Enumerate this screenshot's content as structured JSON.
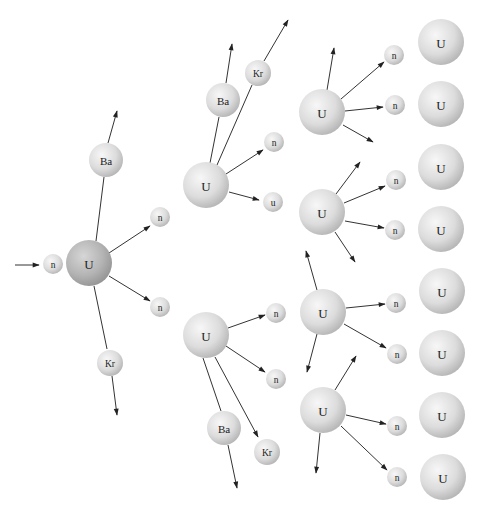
{
  "colors": {
    "background": "#ffffff",
    "line": "#333333",
    "text": "#222222",
    "sphere_light": "#f4f4f4",
    "sphere_dark": "#b5b5b5",
    "sphere_uranium_center_dark": "#a8a8a8"
  },
  "labels": {
    "uranium": "U",
    "neutron": "n",
    "barium": "Ba",
    "krypton": "Kr",
    "neutron_misprint": "u"
  },
  "particles": [
    {
      "id": "g1-n-in",
      "label": "n",
      "x": 53,
      "y": 264,
      "r": 10
    },
    {
      "id": "g1-U",
      "label": "U",
      "x": 89,
      "y": 263,
      "r": 23,
      "dark": true
    },
    {
      "id": "g1-Ba",
      "label": "Ba",
      "x": 106,
      "y": 160,
      "r": 17
    },
    {
      "id": "g1-Kr",
      "label": "Kr",
      "x": 110,
      "y": 363,
      "r": 13
    },
    {
      "id": "g1-n1",
      "label": "n",
      "x": 160,
      "y": 217,
      "r": 10
    },
    {
      "id": "g1-n2",
      "label": "n",
      "x": 160,
      "y": 307,
      "r": 10
    },
    {
      "id": "g2a-U",
      "label": "U",
      "x": 206,
      "y": 185,
      "r": 23
    },
    {
      "id": "g2a-Ba",
      "label": "Ba",
      "x": 223,
      "y": 100,
      "r": 17
    },
    {
      "id": "g2a-Kr",
      "label": "Kr",
      "x": 258,
      "y": 73,
      "r": 13
    },
    {
      "id": "g2a-n1",
      "label": "n",
      "x": 274,
      "y": 142,
      "r": 10
    },
    {
      "id": "g2a-n2",
      "label": "u",
      "x": 273,
      "y": 202,
      "r": 10
    },
    {
      "id": "g2b-U",
      "label": "U",
      "x": 206,
      "y": 335,
      "r": 23
    },
    {
      "id": "g2b-n1",
      "label": "n",
      "x": 276,
      "y": 313,
      "r": 10
    },
    {
      "id": "g2b-n2",
      "label": "n",
      "x": 276,
      "y": 379,
      "r": 10
    },
    {
      "id": "g2b-Ba",
      "label": "Ba",
      "x": 224,
      "y": 428,
      "r": 17
    },
    {
      "id": "g2b-Kr",
      "label": "Kr",
      "x": 267,
      "y": 452,
      "r": 13
    },
    {
      "id": "g3a-U",
      "label": "U",
      "x": 322,
      "y": 112,
      "r": 23
    },
    {
      "id": "g3b-U",
      "label": "U",
      "x": 322,
      "y": 212,
      "r": 23
    },
    {
      "id": "g3c-U",
      "label": "U",
      "x": 323,
      "y": 312,
      "r": 23
    },
    {
      "id": "g3d-U",
      "label": "U",
      "x": 323,
      "y": 410,
      "r": 23
    },
    {
      "id": "g3a-n1",
      "label": "n",
      "x": 394,
      "y": 55,
      "r": 10
    },
    {
      "id": "g3a-n2",
      "label": "n",
      "x": 395,
      "y": 105,
      "r": 10
    },
    {
      "id": "g3b-n1",
      "label": "n",
      "x": 396,
      "y": 180,
      "r": 10
    },
    {
      "id": "g3b-n2",
      "label": "n",
      "x": 395,
      "y": 230,
      "r": 10
    },
    {
      "id": "g3c-n1",
      "label": "n",
      "x": 396,
      "y": 303,
      "r": 10
    },
    {
      "id": "g3c-n2",
      "label": "n",
      "x": 397,
      "y": 354,
      "r": 10
    },
    {
      "id": "g3d-n1",
      "label": "n",
      "x": 397,
      "y": 426,
      "r": 10
    },
    {
      "id": "g3d-n2",
      "label": "n",
      "x": 397,
      "y": 477,
      "r": 10
    },
    {
      "id": "t-U1",
      "label": "U",
      "x": 441,
      "y": 42,
      "r": 23
    },
    {
      "id": "t-U2",
      "label": "U",
      "x": 441,
      "y": 104,
      "r": 23
    },
    {
      "id": "t-U3",
      "label": "U",
      "x": 441,
      "y": 167,
      "r": 23
    },
    {
      "id": "t-U4",
      "label": "U",
      "x": 441,
      "y": 229,
      "r": 23
    },
    {
      "id": "t-U5",
      "label": "U",
      "x": 442,
      "y": 291,
      "r": 23
    },
    {
      "id": "t-U6",
      "label": "U",
      "x": 442,
      "y": 353,
      "r": 23
    },
    {
      "id": "t-U7",
      "label": "U",
      "x": 442,
      "y": 415,
      "r": 23
    },
    {
      "id": "t-U8",
      "label": "U",
      "x": 443,
      "y": 477,
      "r": 23
    }
  ],
  "arrows": [
    {
      "x1": 15,
      "y1": 265,
      "x2": 39,
      "y2": 265,
      "head": true
    },
    {
      "x1": 96,
      "y1": 241,
      "x2": 104,
      "y2": 177,
      "head": false
    },
    {
      "x1": 108,
      "y1": 143,
      "x2": 117,
      "y2": 111,
      "head": true
    },
    {
      "x1": 109,
      "y1": 253,
      "x2": 150,
      "y2": 226,
      "head": true
    },
    {
      "x1": 109,
      "y1": 276,
      "x2": 150,
      "y2": 301,
      "head": true
    },
    {
      "x1": 94,
      "y1": 286,
      "x2": 107,
      "y2": 349,
      "head": false
    },
    {
      "x1": 112,
      "y1": 376,
      "x2": 117,
      "y2": 415,
      "head": true
    },
    {
      "x1": 210,
      "y1": 163,
      "x2": 219,
      "y2": 117,
      "head": false
    },
    {
      "x1": 226,
      "y1": 83,
      "x2": 232,
      "y2": 44,
      "head": true
    },
    {
      "x1": 217,
      "y1": 165,
      "x2": 252,
      "y2": 85,
      "head": false
    },
    {
      "x1": 264,
      "y1": 61,
      "x2": 288,
      "y2": 20,
      "head": true
    },
    {
      "x1": 226,
      "y1": 174,
      "x2": 263,
      "y2": 150,
      "head": true
    },
    {
      "x1": 229,
      "y1": 192,
      "x2": 259,
      "y2": 200,
      "head": true
    },
    {
      "x1": 228,
      "y1": 328,
      "x2": 265,
      "y2": 315,
      "head": true
    },
    {
      "x1": 226,
      "y1": 346,
      "x2": 265,
      "y2": 372,
      "head": true
    },
    {
      "x1": 203,
      "y1": 358,
      "x2": 221,
      "y2": 411,
      "head": false
    },
    {
      "x1": 228,
      "y1": 445,
      "x2": 237,
      "y2": 488,
      "head": true
    },
    {
      "x1": 215,
      "y1": 357,
      "x2": 258,
      "y2": 437,
      "head": true
    },
    {
      "x1": 327,
      "y1": 90,
      "x2": 334,
      "y2": 48,
      "head": true
    },
    {
      "x1": 341,
      "y1": 99,
      "x2": 384,
      "y2": 62,
      "head": true
    },
    {
      "x1": 345,
      "y1": 111,
      "x2": 383,
      "y2": 107,
      "head": true
    },
    {
      "x1": 343,
      "y1": 125,
      "x2": 373,
      "y2": 142,
      "head": true
    },
    {
      "x1": 336,
      "y1": 194,
      "x2": 360,
      "y2": 162,
      "head": true
    },
    {
      "x1": 344,
      "y1": 203,
      "x2": 385,
      "y2": 186,
      "head": true
    },
    {
      "x1": 345,
      "y1": 221,
      "x2": 384,
      "y2": 228,
      "head": true
    },
    {
      "x1": 335,
      "y1": 232,
      "x2": 355,
      "y2": 262,
      "head": true
    },
    {
      "x1": 317,
      "y1": 290,
      "x2": 306,
      "y2": 251,
      "head": true
    },
    {
      "x1": 346,
      "y1": 308,
      "x2": 385,
      "y2": 304,
      "head": true
    },
    {
      "x1": 344,
      "y1": 324,
      "x2": 386,
      "y2": 348,
      "head": true
    },
    {
      "x1": 317,
      "y1": 334,
      "x2": 307,
      "y2": 372,
      "head": true
    },
    {
      "x1": 335,
      "y1": 390,
      "x2": 356,
      "y2": 356,
      "head": true
    },
    {
      "x1": 346,
      "y1": 415,
      "x2": 386,
      "y2": 424,
      "head": true
    },
    {
      "x1": 341,
      "y1": 426,
      "x2": 387,
      "y2": 470,
      "head": true
    },
    {
      "x1": 320,
      "y1": 433,
      "x2": 316,
      "y2": 473,
      "head": true
    }
  ]
}
